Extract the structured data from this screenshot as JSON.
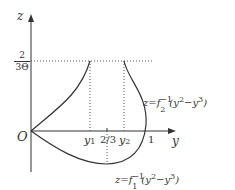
{
  "diagram": {
    "axes": {
      "z_label": "z",
      "y_label": "y",
      "origin_label": "O"
    },
    "z_tick": {
      "numerator": "2",
      "denominator": "3Θ"
    },
    "y_ticks": {
      "y1": "y",
      "y1_sub": "1",
      "two_thirds": "2/3",
      "y2": "y",
      "y2_sub": "2",
      "one": "1"
    },
    "curve_labels": {
      "upper": {
        "prefix": "z=f",
        "sub": "2",
        "sup": "−1",
        "arg_open": "(y",
        "sq": "2",
        "mid": "−y",
        "cube": "3",
        "close": ")"
      },
      "lower": {
        "prefix": "z=f",
        "sub": "1",
        "sup": "−1",
        "arg_open": "(y",
        "sq": "2",
        "mid": "−y",
        "cube": "3",
        "close": ")"
      }
    },
    "colors": {
      "stroke": "#333333",
      "dotted": "#555555"
    }
  }
}
